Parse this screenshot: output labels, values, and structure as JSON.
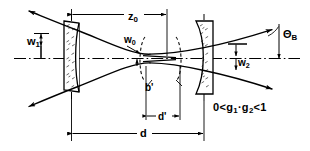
{
  "figure": {
    "domain": "optics-diagram",
    "background_color": "#ffffff",
    "line_color": "#000000"
  },
  "labels": {
    "z0": {
      "base": "z",
      "sub": "0",
      "name": "rayleigh-distance-label"
    },
    "w1": {
      "base": "w",
      "sub": "1",
      "name": "spot-size-mirror1-label"
    },
    "w0": {
      "base": "w",
      "sub": "0",
      "name": "beam-waist-label"
    },
    "w2": {
      "base": "w",
      "sub": "2",
      "name": "spot-size-mirror2-label"
    },
    "theta_b": {
      "base": "Θ",
      "sub": "B",
      "name": "beam-divergence-angle-label"
    },
    "b_prime": {
      "base": "b'",
      "sub": "",
      "name": "confocal-parameter-label"
    },
    "d_prime": {
      "base": "d'",
      "sub": "",
      "name": "inner-distance-label"
    },
    "d": {
      "base": "d",
      "sub": "",
      "name": "resonator-length-label"
    }
  },
  "stability_condition": {
    "text": "0 < g1 · g2 < 1",
    "parts": [
      "0",
      "<",
      "g",
      "1",
      "·",
      "g",
      "2",
      "<",
      "1"
    ],
    "lhs": "0",
    "op1": "<",
    "g1_base": "g",
    "g1_sub": "1",
    "dot": "·",
    "g2_base": "g",
    "g2_sub": "2",
    "op2": "<",
    "rhs": "1"
  },
  "elements": {
    "mirror_left": {
      "name": "mirror-left",
      "type": "concave-mirror",
      "hatched": true
    },
    "mirror_right": {
      "name": "mirror-right",
      "type": "concave-mirror",
      "hatched": true
    },
    "optical_axis": {
      "name": "optical-axis",
      "style": "dash-dot"
    },
    "beam_envelope": {
      "name": "beam-envelope-hyperbola"
    },
    "waist_arcs": {
      "name": "wavefront-arcs",
      "style": "dashed"
    }
  },
  "dimensions": {
    "z0_extent": "mirror-1 to beam waist",
    "d_extent": "mirror-1 to mirror-2",
    "d_prime_extent": "confocal region width",
    "b_prime_extent": "confocal parameter region"
  }
}
